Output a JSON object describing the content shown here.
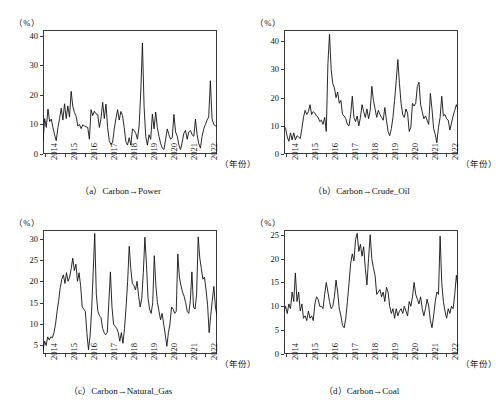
{
  "figure": {
    "unit_label": "（%）",
    "xaxis_label": "（年份）",
    "year_ticks": [
      "2014",
      "2015",
      "2016",
      "2017",
      "2018",
      "2019",
      "2020",
      "2021",
      "2022"
    ]
  },
  "panels": [
    {
      "key": "a",
      "caption_index": "（a）",
      "caption_text": "Carbon→Power",
      "unit_label": "（%）",
      "xaxis_label": "（年份）",
      "yticks": [
        "0",
        "10",
        "20",
        "30",
        "40"
      ]
    },
    {
      "key": "b",
      "caption_index": "（b）",
      "caption_text": "Carbon→Crude_Oil",
      "unit_label": "（%）",
      "xaxis_label": "（年份）",
      "yticks": [
        "0",
        "10",
        "20",
        "30",
        "40"
      ]
    },
    {
      "key": "c",
      "caption_index": "（c）",
      "caption_text": "Carbon→Natural_Gas",
      "unit_label": "（%）",
      "xaxis_label": "（年份）",
      "yticks": [
        "5",
        "10",
        "15",
        "20",
        "25",
        "30"
      ]
    },
    {
      "key": "d",
      "caption_index": "（d）",
      "caption_text": "Carbon→Coal",
      "unit_label": "（%）",
      "xaxis_label": "（年份）",
      "yticks": [
        "0",
        "5",
        "10",
        "15",
        "20",
        "25"
      ]
    }
  ],
  "chart_data": [
    {
      "type": "line",
      "panel": "a",
      "title": "（a）Carbon→Power",
      "xlabel": "（年份）",
      "ylabel": "（%）",
      "ylim": [
        0,
        42
      ],
      "yticks": [
        0,
        10,
        20,
        30,
        40
      ],
      "xlim": [
        "2014-01",
        "2022-10"
      ],
      "xticks": [
        "2014",
        "2015",
        "2016",
        "2017",
        "2018",
        "2019",
        "2020",
        "2021",
        "2022"
      ],
      "grid": false,
      "legend": "none",
      "series": [
        {
          "name": "Carbon→Power spillover",
          "values": [
            4.0,
            12.0,
            9.0,
            15.2,
            11.0,
            11.8,
            9.0,
            6.5,
            4.5,
            9.0,
            12.0,
            15.5,
            11.5,
            17.0,
            12.0,
            16.3,
            12.5,
            21.2,
            16.0,
            14.0,
            12.8,
            9.5,
            10.0,
            8.6,
            9.9,
            9.5,
            9.2,
            9.0,
            5.0,
            15.0,
            13.0,
            14.5,
            13.6,
            13.4,
            9.0,
            12.0,
            17.5,
            12.0,
            16.9,
            9.0,
            4.5,
            3.2,
            4.0,
            8.5,
            12.0,
            15.0,
            11.5,
            14.4,
            13.0,
            9.0,
            4.2,
            3.0,
            5.5,
            3.0,
            8.5,
            8.0,
            7.0,
            5.0,
            9.5,
            21.0,
            37.6,
            16.0,
            6.0,
            3.0,
            6.5,
            5.0,
            13.5,
            8.5,
            14.2,
            9.0,
            6.0,
            3.5,
            2.0,
            1.5,
            5.0,
            8.5,
            6.5,
            5.0,
            5.5,
            13.4,
            7.5,
            6.0,
            3.0,
            1.5,
            4.0,
            7.0,
            8.0,
            5.0,
            7.5,
            8.0,
            6.5,
            6.0,
            11.8,
            6.5,
            3.5,
            2.0,
            6.0,
            8.5,
            10.0,
            11.5,
            12.5,
            24.8,
            12.0,
            10.0,
            9.6,
            9.4
          ]
        }
      ]
    },
    {
      "type": "line",
      "panel": "b",
      "title": "（b）Carbon→Crude_Oil",
      "xlabel": "（年份）",
      "ylabel": "（%）",
      "ylim": [
        0,
        44
      ],
      "yticks": [
        0,
        10,
        20,
        30,
        40
      ],
      "xlim": [
        "2014-01",
        "2022-10"
      ],
      "xticks": [
        "2014",
        "2015",
        "2016",
        "2017",
        "2018",
        "2019",
        "2020",
        "2021",
        "2022"
      ],
      "grid": false,
      "legend": "none",
      "series": [
        {
          "name": "Carbon→Crude_Oil spillover",
          "values": [
            10.0,
            9.0,
            6.0,
            4.5,
            7.5,
            5.0,
            7.5,
            5.0,
            6.5,
            6.0,
            5.5,
            9.0,
            13.0,
            15.5,
            14.0,
            15.0,
            17.5,
            14.0,
            15.0,
            14.5,
            13.5,
            13.0,
            11.5,
            12.0,
            10.5,
            13.0,
            8.0,
            32.0,
            42.5,
            30.0,
            25.0,
            23.5,
            20.0,
            22.0,
            18.0,
            19.0,
            14.0,
            13.5,
            12.5,
            10.5,
            10.0,
            14.0,
            20.5,
            13.0,
            11.5,
            13.5,
            10.0,
            13.0,
            17.5,
            15.0,
            13.0,
            16.0,
            12.5,
            15.5,
            24.0,
            19.0,
            16.0,
            13.0,
            15.5,
            14.0,
            13.0,
            12.0,
            16.5,
            12.0,
            8.0,
            6.5,
            9.0,
            13.0,
            19.0,
            26.0,
            33.5,
            25.0,
            18.0,
            14.0,
            13.0,
            16.0,
            14.5,
            8.0,
            9.5,
            18.0,
            17.0,
            18.0,
            24.0,
            25.5,
            17.5,
            15.0,
            12.5,
            13.5,
            12.0,
            10.5,
            21.5,
            16.0,
            9.0,
            7.0,
            4.0,
            9.5,
            13.0,
            20.5,
            13.5,
            14.0,
            12.5,
            12.0,
            8.5,
            11.0,
            13.5,
            15.5,
            17.5,
            16.0
          ]
        }
      ]
    },
    {
      "type": "line",
      "panel": "c",
      "title": "（c）Carbon→Natural_Gas",
      "xlabel": "（年份）",
      "ylabel": "（%）",
      "ylim": [
        3,
        32
      ],
      "yticks": [
        5,
        10,
        15,
        20,
        25,
        30
      ],
      "xlim": [
        "2014-01",
        "2022-10"
      ],
      "xticks": [
        "2014",
        "2015",
        "2016",
        "2017",
        "2018",
        "2019",
        "2020",
        "2021",
        "2022"
      ],
      "grid": false,
      "legend": "none",
      "series": [
        {
          "name": "Carbon→Natural_Gas spillover",
          "values": [
            3.8,
            6.0,
            5.0,
            7.0,
            6.3,
            7.0,
            6.8,
            8.0,
            10.0,
            13.0,
            15.5,
            18.5,
            20.5,
            21.5,
            19.5,
            22.0,
            20.0,
            21.0,
            23.0,
            25.4,
            22.5,
            24.0,
            20.0,
            22.0,
            19.0,
            14.0,
            13.5,
            13.0,
            8.0,
            4.0,
            7.0,
            13.0,
            22.0,
            31.2,
            17.0,
            13.0,
            12.0,
            11.5,
            9.0,
            8.0,
            7.5,
            8.0,
            15.0,
            22.2,
            14.0,
            10.0,
            9.5,
            9.0,
            8.0,
            6.0,
            8.0,
            5.5,
            9.0,
            14.0,
            20.0,
            28.2,
            23.0,
            19.5,
            19.0,
            18.0,
            20.0,
            16.5,
            14.0,
            16.0,
            22.0,
            30.3,
            24.0,
            16.0,
            13.5,
            12.5,
            15.0,
            26.0,
            19.0,
            15.0,
            13.0,
            11.0,
            12.5,
            10.0,
            7.5,
            4.8,
            8.0,
            10.0,
            14.0,
            13.5,
            12.5,
            13.0,
            26.4,
            21.0,
            19.0,
            17.5,
            16.5,
            15.0,
            13.0,
            12.5,
            15.5,
            22.2,
            14.0,
            13.5,
            17.0,
            30.4,
            25.5,
            23.0,
            20.5,
            21.0,
            18.0,
            14.5,
            8.0,
            12.0,
            15.5,
            18.8,
            14.0,
            12.0
          ]
        }
      ]
    },
    {
      "type": "line",
      "panel": "d",
      "title": "（d）Carbon→Coal",
      "xlabel": "（年份）",
      "ylabel": "（%）",
      "ylim": [
        0,
        26
      ],
      "yticks": [
        0,
        5,
        10,
        15,
        20,
        25
      ],
      "xlim": [
        "2014-01",
        "2022-10"
      ],
      "xticks": [
        "2014",
        "2015",
        "2016",
        "2017",
        "2018",
        "2019",
        "2020",
        "2021",
        "2022"
      ],
      "grid": false,
      "legend": "none",
      "series": [
        {
          "name": "Carbon→Coal spillover",
          "values": [
            9.0,
            10.0,
            8.5,
            10.5,
            9.5,
            13.0,
            11.0,
            17.0,
            11.0,
            13.0,
            9.0,
            10.5,
            7.5,
            8.0,
            7.0,
            9.0,
            7.5,
            8.0,
            7.0,
            10.5,
            12.0,
            11.5,
            10.0,
            10.0,
            9.5,
            12.5,
            15.0,
            13.0,
            11.0,
            9.5,
            10.0,
            12.0,
            15.5,
            13.0,
            9.5,
            8.0,
            6.0,
            5.5,
            7.5,
            11.0,
            15.0,
            19.0,
            21.0,
            19.5,
            24.0,
            25.3,
            21.5,
            23.0,
            20.5,
            22.5,
            18.0,
            14.5,
            20.0,
            25.0,
            20.0,
            18.0,
            16.5,
            12.5,
            13.0,
            13.5,
            12.0,
            13.0,
            11.0,
            14.0,
            13.0,
            10.0,
            8.5,
            9.5,
            7.5,
            9.5,
            8.0,
            9.0,
            9.5,
            8.5,
            10.0,
            9.0,
            8.0,
            11.0,
            10.0,
            12.0,
            15.0,
            12.5,
            11.5,
            10.5,
            12.0,
            9.5,
            8.0,
            9.5,
            11.5,
            10.0,
            7.0,
            5.5,
            8.0,
            11.0,
            13.0,
            12.5,
            24.7,
            15.0,
            11.0,
            9.0,
            7.5,
            9.5,
            8.5,
            10.0,
            9.5,
            12.5,
            16.5,
            14.0
          ]
        }
      ]
    }
  ]
}
